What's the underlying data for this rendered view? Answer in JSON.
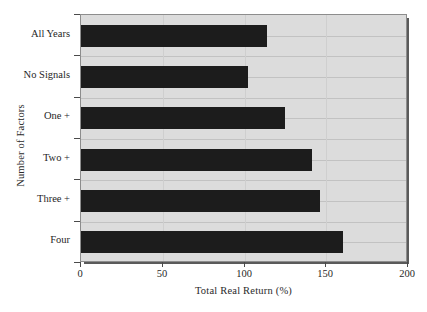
{
  "chart_data": {
    "type": "bar",
    "orientation": "horizontal",
    "title": "",
    "xlabel": "Total Real Return (%)",
    "ylabel": "Number of Factors",
    "categories": [
      "All Years",
      "No Signals",
      "One +",
      "Two +",
      "Three +",
      "Four"
    ],
    "values": [
      114,
      102,
      125,
      141,
      146,
      160
    ],
    "xlim": [
      0,
      200
    ],
    "xticks": [
      0,
      50,
      100,
      150,
      200
    ],
    "xticklabels": [
      "0",
      "50",
      "100",
      "150",
      "200"
    ],
    "grid": true,
    "legend": false,
    "colors": {
      "bar": "#1c1c1c",
      "plot_background": "#dcdcdc",
      "page_background": "#ffffff",
      "gridline": "#c2c2c2",
      "axis": "#4a4a4a",
      "text": "#1f1f1f"
    }
  }
}
